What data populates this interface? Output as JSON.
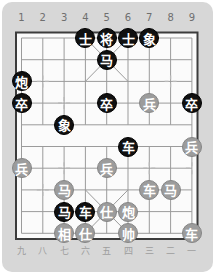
{
  "board": {
    "top_file_labels": [
      "1",
      "2",
      "3",
      "4",
      "5",
      "6",
      "7",
      "8",
      "9"
    ],
    "bottom_file_labels": [
      "九",
      "八",
      "七",
      "六",
      "五",
      "四",
      "三",
      "二",
      "一"
    ],
    "colors": {
      "card_bg": "#d7d7d7",
      "board_bg": "#fbfbfb",
      "frame": "#3c3c3c",
      "grid_line": "#9b9b9b",
      "marker": "#b9b9b9",
      "black_piece": "#101010",
      "gray_piece": "#9c9c9c",
      "piece_text": "#ffffff",
      "top_label_color": "#6f6f6f",
      "bottom_label_color": "#9e9e9e"
    },
    "files": 9,
    "rows": 10
  },
  "pieces": [
    {
      "label": "士",
      "name": "black-advisor",
      "side": "black",
      "file": 4,
      "row": 0
    },
    {
      "label": "将",
      "name": "black-general",
      "side": "black",
      "file": 5,
      "row": 0
    },
    {
      "label": "士",
      "name": "black-advisor",
      "side": "black",
      "file": 6,
      "row": 0
    },
    {
      "label": "象",
      "name": "black-elephant",
      "side": "black",
      "file": 7,
      "row": 0
    },
    {
      "label": "马",
      "name": "black-horse",
      "side": "black",
      "file": 5,
      "row": 1
    },
    {
      "label": "炮",
      "name": "black-cannon",
      "side": "black",
      "file": 1,
      "row": 2
    },
    {
      "label": "卒",
      "name": "black-soldier",
      "side": "black",
      "file": 1,
      "row": 3
    },
    {
      "label": "卒",
      "name": "black-soldier",
      "side": "black",
      "file": 5,
      "row": 3
    },
    {
      "label": "卒",
      "name": "black-soldier",
      "side": "black",
      "file": 9,
      "row": 3
    },
    {
      "label": "象",
      "name": "black-elephant",
      "side": "black",
      "file": 3,
      "row": 4
    },
    {
      "label": "车",
      "name": "black-chariot",
      "side": "black",
      "file": 6,
      "row": 5
    },
    {
      "label": "马",
      "name": "black-horse",
      "side": "black",
      "file": 3,
      "row": 8
    },
    {
      "label": "车",
      "name": "black-chariot",
      "side": "black",
      "file": 4,
      "row": 8
    },
    {
      "label": "兵",
      "name": "red-soldier",
      "side": "gray",
      "file": 7,
      "row": 3
    },
    {
      "label": "兵",
      "name": "red-soldier",
      "side": "gray",
      "file": 9,
      "row": 5
    },
    {
      "label": "兵",
      "name": "red-soldier",
      "side": "gray",
      "file": 1,
      "row": 6
    },
    {
      "label": "兵",
      "name": "red-soldier",
      "side": "gray",
      "file": 5,
      "row": 6
    },
    {
      "label": "马",
      "name": "red-horse",
      "side": "gray",
      "file": 3,
      "row": 7
    },
    {
      "label": "车",
      "name": "red-chariot",
      "side": "gray",
      "file": 7,
      "row": 7
    },
    {
      "label": "马",
      "name": "red-horse",
      "side": "gray",
      "file": 8,
      "row": 7
    },
    {
      "label": "仕",
      "name": "red-advisor",
      "side": "gray",
      "file": 5,
      "row": 8
    },
    {
      "label": "炮",
      "name": "red-cannon",
      "side": "gray",
      "file": 6,
      "row": 8
    },
    {
      "label": "相",
      "name": "red-elephant",
      "side": "gray",
      "file": 3,
      "row": 9
    },
    {
      "label": "仕",
      "name": "red-advisor",
      "side": "gray",
      "file": 4,
      "row": 9
    },
    {
      "label": "帅",
      "name": "red-general",
      "side": "gray",
      "file": 6,
      "row": 9
    },
    {
      "label": "车",
      "name": "red-chariot",
      "side": "gray",
      "file": 9,
      "row": 9
    }
  ]
}
